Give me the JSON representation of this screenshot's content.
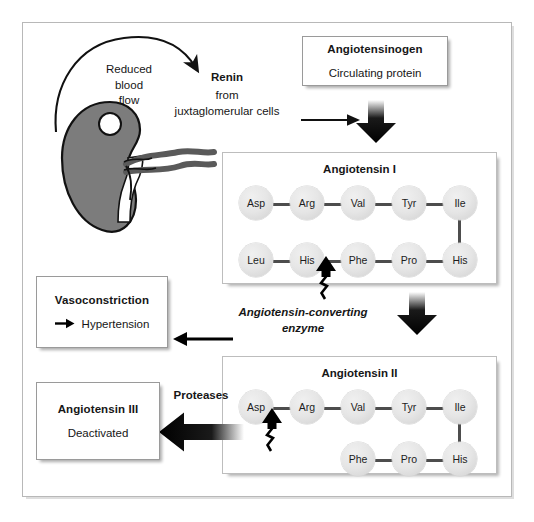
{
  "figure": {
    "frame_color": "#b8b8b8",
    "aa_circle_color": "#e3e3e3",
    "bond_color": "#4d4d4d"
  },
  "kidney": {
    "label_line1": "Reduced",
    "label_line2": "blood",
    "label_line3": "flow",
    "body_color": "#7c7c7c",
    "glomerulus_color": "#ffffff",
    "vessel_color": "#5a5a5a"
  },
  "renin": {
    "name": "Renin",
    "source_line1": "from",
    "source_line2": "juxtaglomerular cells"
  },
  "angiotensinogen": {
    "title": "Angiotensinogen",
    "subtitle": "Circulating protein"
  },
  "ace": {
    "line1": "Angiotensin-converting",
    "line2": "enzyme"
  },
  "proteases": {
    "label": "Proteases"
  },
  "vasoconstriction": {
    "title": "Vasoconstriction",
    "subtitle": "Hypertension",
    "arrow_icon": "right-arrow-icon"
  },
  "angiotensin3": {
    "title": "Angiotensin III",
    "subtitle": "Deactivated"
  },
  "angiotensin1": {
    "title": "Angiotensin I",
    "top_row": [
      "Asp",
      "Arg",
      "Val",
      "Tyr",
      "Ile"
    ],
    "bottom_row": [
      "Leu",
      "His",
      "Phe",
      "Pro",
      "His"
    ],
    "cleavage_between": [
      "His",
      "Phe"
    ]
  },
  "angiotensin2": {
    "title": "Angiotensin II",
    "top_row": [
      "Asp",
      "Arg",
      "Val",
      "Tyr",
      "Ile"
    ],
    "bottom_row": [
      "Phe",
      "Pro",
      "His"
    ],
    "cleavage_between": [
      "Asp",
      "Arg"
    ]
  }
}
